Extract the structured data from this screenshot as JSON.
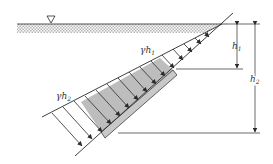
{
  "diagram": {
    "labels": {
      "gamma_h1": "γh",
      "gamma_h1_sub": "1",
      "gamma_h2": "γh",
      "gamma_h2_sub": "2",
      "h1": "h",
      "h1_sub": "1",
      "h2": "h",
      "h2_sub": "2"
    },
    "symbols": {
      "free_surface": "inverted-triangle"
    },
    "colors": {
      "line": "#2a2a2a",
      "gate_fill": "#c8c8c8",
      "pressure_fill": "#bdbdbd",
      "water_hatch": "#b0b0b0"
    }
  }
}
